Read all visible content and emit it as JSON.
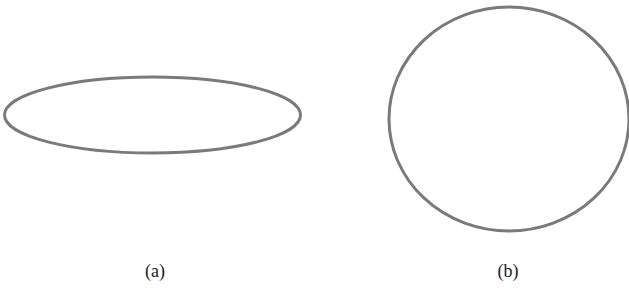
{
  "figure": {
    "stroke_color": "#7a7a7a",
    "stroke_width": 3,
    "panels": [
      {
        "id": "a",
        "label": "(a)",
        "shape": "ellipse",
        "cx": 152.5,
        "cy": 115,
        "rx": 148,
        "ry": 38,
        "label_x": 155,
        "label_y": 261
      },
      {
        "id": "b",
        "label": "(b)",
        "shape": "circle",
        "cx": 509,
        "cy": 119,
        "rx": 120,
        "ry": 112,
        "label_x": 508,
        "label_y": 261
      }
    ]
  }
}
